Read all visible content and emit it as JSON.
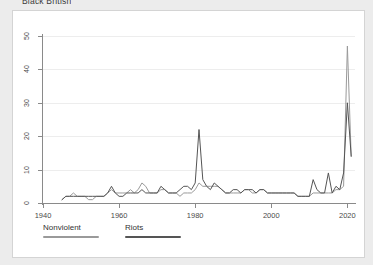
{
  "page": {
    "title": "Black British",
    "background_color": "#ececec",
    "card_background": "#ffffff",
    "card_border_color": "#d4d4d4"
  },
  "legend": {
    "position": "bottom-left",
    "items": [
      {
        "label": "Nonviolent",
        "color": "#9a9a9a",
        "name": "legend-nonviolent"
      },
      {
        "label": "Riots",
        "color": "#555555",
        "name": "legend-riots"
      }
    ]
  },
  "chart_data": {
    "type": "line",
    "title": "Black British",
    "xlabel": "",
    "ylabel": "",
    "xlim": [
      1940,
      2022
    ],
    "ylim": [
      0,
      50
    ],
    "xticks": [
      1940,
      1960,
      1980,
      2000,
      2020
    ],
    "yticks": [
      0,
      10,
      20,
      30,
      40,
      50
    ],
    "grid": true,
    "grid_axis": "y",
    "legend_position": "bottom-left",
    "x": [
      1945,
      1946,
      1947,
      1948,
      1949,
      1950,
      1951,
      1952,
      1953,
      1954,
      1955,
      1956,
      1957,
      1958,
      1959,
      1960,
      1961,
      1962,
      1963,
      1964,
      1965,
      1966,
      1967,
      1968,
      1969,
      1970,
      1971,
      1972,
      1973,
      1974,
      1975,
      1976,
      1977,
      1978,
      1979,
      1980,
      1981,
      1982,
      1983,
      1984,
      1985,
      1986,
      1987,
      1988,
      1989,
      1990,
      1991,
      1992,
      1993,
      1994,
      1995,
      1996,
      1997,
      1998,
      1999,
      2000,
      2001,
      2002,
      2003,
      2004,
      2005,
      2006,
      2007,
      2008,
      2009,
      2010,
      2011,
      2012,
      2013,
      2014,
      2015,
      2016,
      2017,
      2018,
      2019,
      2020,
      2021
    ],
    "series": [
      {
        "name": "Nonviolent",
        "color": "#9a9a9a",
        "values": [
          1,
          2,
          2,
          3,
          2,
          2,
          2,
          1,
          1,
          2,
          2,
          2,
          3,
          4,
          3,
          3,
          3,
          3,
          4,
          3,
          4,
          6,
          5,
          3,
          3,
          3,
          4,
          4,
          3,
          3,
          3,
          2,
          3,
          3,
          3,
          4,
          6,
          5,
          5,
          5,
          5,
          5,
          4,
          3,
          3,
          3,
          3,
          3,
          4,
          4,
          3,
          3,
          4,
          4,
          3,
          3,
          3,
          3,
          3,
          3,
          3,
          3,
          2,
          2,
          2,
          2,
          3,
          3,
          3,
          3,
          3,
          3,
          4,
          4,
          5,
          47,
          14
        ]
      },
      {
        "name": "Riots",
        "color": "#555555",
        "values": [
          1,
          2,
          2,
          2,
          2,
          2,
          2,
          2,
          2,
          2,
          2,
          2,
          3,
          5,
          3,
          2,
          2,
          3,
          3,
          3,
          3,
          4,
          3,
          3,
          3,
          3,
          5,
          4,
          3,
          3,
          3,
          4,
          5,
          5,
          4,
          6,
          22,
          7,
          5,
          4,
          6,
          5,
          4,
          3,
          3,
          4,
          4,
          3,
          4,
          4,
          4,
          3,
          4,
          4,
          3,
          3,
          3,
          3,
          3,
          3,
          3,
          3,
          2,
          2,
          2,
          2,
          7,
          4,
          3,
          3,
          9,
          3,
          5,
          4,
          9,
          30,
          14
        ]
      }
    ]
  }
}
